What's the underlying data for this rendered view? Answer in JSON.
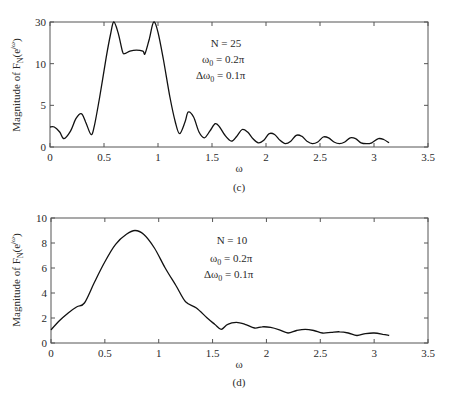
{
  "chart_data": [
    {
      "id": "c",
      "type": "line",
      "caption": "(c)",
      "title": "",
      "xlabel": "ω",
      "ylabel": "Magnitude of F_N(e^{jω})",
      "xlim": [
        0,
        3.5
      ],
      "xticks": [
        0,
        0.5,
        1,
        1.5,
        2,
        2.5,
        3,
        3.5
      ],
      "xtick_labels": [
        "0",
        "0.5",
        "1",
        "1.5",
        "2",
        "2.5",
        "3",
        "3.5"
      ],
      "yticks": [
        0,
        5,
        10,
        30
      ],
      "ytick_labels": [
        "0",
        "5",
        "10",
        "30"
      ],
      "y_scale_note": "equally spaced ticks at 0, 5, 10, 30 (non-linear axis)",
      "grid": false,
      "annotations": [
        "N = 25",
        "ω₀ = 0.2π",
        "Δω₀ = 0.1π"
      ],
      "series": [
        {
          "name": "N = 25",
          "x": [
            0,
            0.04,
            0.09,
            0.13,
            0.19,
            0.24,
            0.29,
            0.33,
            0.38,
            0.41,
            0.46,
            0.52,
            0.56,
            0.59,
            0.63,
            0.67,
            0.69,
            0.74,
            0.8,
            0.86,
            0.88,
            0.92,
            0.96,
            1.0,
            1.05,
            1.11,
            1.16,
            1.2,
            1.25,
            1.28,
            1.33,
            1.38,
            1.43,
            1.48,
            1.53,
            1.57,
            1.62,
            1.68,
            1.73,
            1.78,
            1.83,
            1.88,
            1.93,
            1.98,
            2.03,
            2.08,
            2.13,
            2.18,
            2.23,
            2.28,
            2.33,
            2.38,
            2.43,
            2.48,
            2.53,
            2.58,
            2.63,
            2.68,
            2.73,
            2.78,
            2.83,
            2.88,
            2.93,
            2.98,
            3.04,
            3.09,
            3.14
          ],
          "values": [
            2.4,
            2.4,
            1.8,
            1.0,
            1.9,
            3.4,
            4.0,
            3.0,
            1.5,
            2.5,
            6.0,
            13.0,
            24.0,
            30.0,
            25.0,
            16.0,
            14.8,
            16.0,
            16.5,
            16.0,
            14.8,
            22.0,
            30.0,
            25.0,
            12.0,
            6.0,
            3.0,
            1.6,
            3.0,
            4.2,
            3.6,
            1.8,
            1.1,
            1.9,
            2.8,
            2.4,
            1.4,
            0.7,
            1.3,
            2.1,
            1.8,
            1.0,
            0.5,
            0.8,
            1.6,
            1.5,
            0.8,
            0.4,
            0.7,
            1.4,
            1.3,
            0.7,
            0.4,
            0.6,
            1.2,
            1.1,
            0.6,
            0.4,
            0.6,
            1.1,
            1.0,
            0.5,
            0.4,
            0.5,
            1.0,
            0.9,
            0.5
          ]
        }
      ]
    },
    {
      "id": "d",
      "type": "line",
      "caption": "(d)",
      "title": "",
      "xlabel": "ω",
      "ylabel": "Magnitude of F_N(e^{jω})",
      "xlim": [
        0,
        3.5
      ],
      "ylim": [
        0,
        10
      ],
      "xticks": [
        0,
        0.5,
        1,
        1.5,
        2,
        2.5,
        3,
        3.5
      ],
      "xtick_labels": [
        "0",
        "0.5",
        "1",
        "1.5",
        "2",
        "2.5",
        "3",
        "3.5"
      ],
      "yticks": [
        0,
        2,
        4,
        6,
        8,
        10
      ],
      "ytick_labels": [
        "0",
        "2",
        "4",
        "6",
        "8",
        "10"
      ],
      "grid": false,
      "annotations": [
        "N = 10",
        "ω₀ = 0.2π",
        "Δω₀ = 0.1π"
      ],
      "series": [
        {
          "name": "N = 10",
          "x": [
            0,
            0.08,
            0.16,
            0.24,
            0.31,
            0.4,
            0.5,
            0.6,
            0.7,
            0.78,
            0.86,
            0.96,
            1.06,
            1.16,
            1.25,
            1.35,
            1.45,
            1.52,
            1.58,
            1.64,
            1.72,
            1.8,
            1.89,
            1.96,
            2.04,
            2.12,
            2.2,
            2.28,
            2.36,
            2.44,
            2.52,
            2.6,
            2.68,
            2.76,
            2.84,
            2.92,
            3.0,
            3.08,
            3.14
          ],
          "values": [
            1.05,
            1.8,
            2.4,
            2.9,
            3.2,
            4.8,
            6.5,
            7.9,
            8.7,
            9.0,
            8.7,
            7.6,
            6.0,
            4.6,
            3.3,
            2.8,
            2.0,
            1.5,
            1.1,
            1.5,
            1.65,
            1.5,
            1.2,
            1.3,
            1.25,
            1.05,
            0.8,
            1.0,
            1.1,
            1.0,
            0.8,
            0.85,
            0.9,
            0.8,
            0.6,
            0.75,
            0.8,
            0.7,
            0.6
          ]
        }
      ]
    }
  ],
  "figure": {
    "panels": [
      {
        "caption": "(c)",
        "xlabel": "ω",
        "ylabel_main": "Magnitude of F",
        "ylabel_sub": "N",
        "ylabel_tail": "(e",
        "ylabel_sup": "jω",
        "ylabel_close": ")",
        "annot": [
          {
            "pre": "N = 25",
            "sub": "",
            "post": ""
          },
          {
            "pre": "ω",
            "sub": "0",
            "post": " = 0.2π"
          },
          {
            "pre": "Δω",
            "sub": "0",
            "post": " = 0.1π"
          }
        ]
      },
      {
        "caption": "(d)",
        "xlabel": "ω",
        "ylabel_main": "Magnitude of F",
        "ylabel_sub": "N",
        "ylabel_tail": "(e",
        "ylabel_sup": "jω",
        "ylabel_close": ")",
        "annot": [
          {
            "pre": "N = 10",
            "sub": "",
            "post": ""
          },
          {
            "pre": "ω",
            "sub": "0",
            "post": "  = 0.2π"
          },
          {
            "pre": "Δω",
            "sub": "0",
            "post": "  = 0.1π"
          }
        ]
      }
    ]
  }
}
